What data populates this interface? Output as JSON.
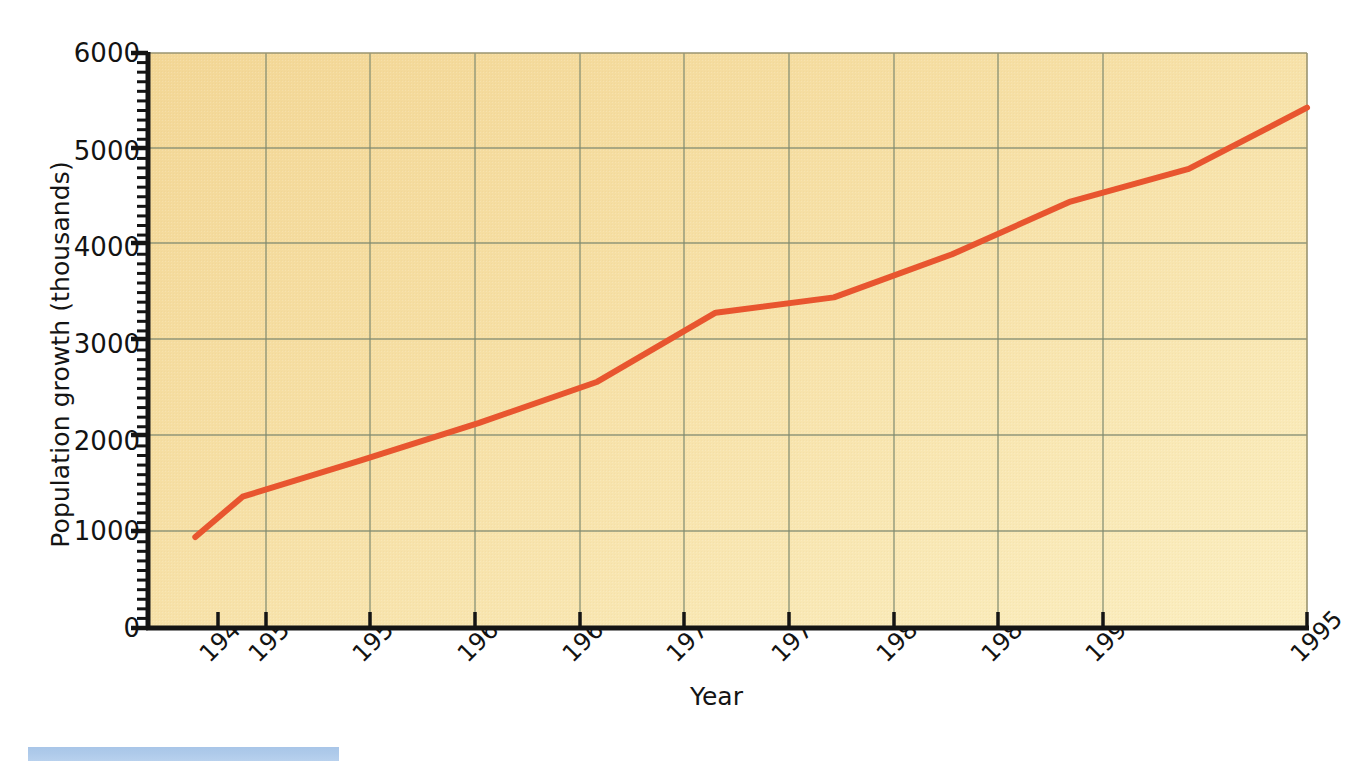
{
  "chart_data": {
    "type": "line",
    "title": "",
    "xlabel": "Year",
    "ylabel": "Population growth (thousands)",
    "x": [
      1948,
      1950,
      1955,
      1960,
      1965,
      1970,
      1975,
      1980,
      1985,
      1990,
      1995
    ],
    "values": [
      950,
      1370,
      1750,
      2140,
      2570,
      3290,
      3450,
      3900,
      4450,
      4790,
      5430
    ],
    "series": [
      {
        "name": "Population growth",
        "color": "#e8552f",
        "values": [
          950,
          1370,
          1750,
          2140,
          2570,
          3290,
          3450,
          3900,
          4450,
          4790,
          5430
        ]
      }
    ],
    "xtick_labels": [
      "1948",
      "1950",
      "1955",
      "1960",
      "1965",
      "1970",
      "1975",
      "1980",
      "1985",
      "1990",
      "1995"
    ],
    "ytick_labels": [
      "0",
      "1000",
      "2000",
      "3000",
      "4000",
      "5000",
      "6000"
    ],
    "ytick_values": [
      0,
      1000,
      2000,
      3000,
      4000,
      5000,
      6000
    ],
    "xlim": [
      1946.0,
      1995.0
    ],
    "ylim": [
      0,
      6000
    ],
    "grid": true,
    "minor_ticks_y": true,
    "legend": "none",
    "plot_background": "#f6dfa2",
    "grid_color": "#8a8f72",
    "axis_color": "#1a1a1a"
  },
  "decor": {
    "bottom_bar_color": "#aecaea"
  }
}
